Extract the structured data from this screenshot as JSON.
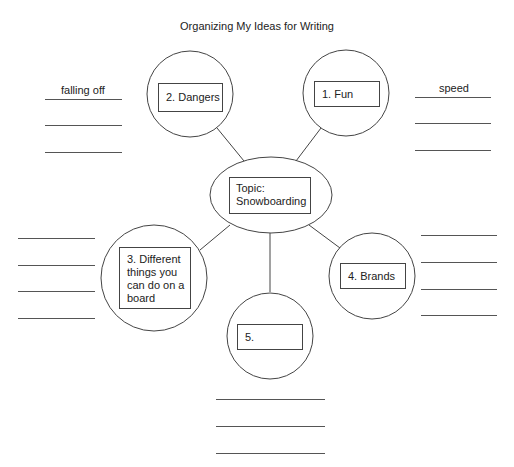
{
  "title": "Organizing My Ideas for Writing",
  "topic": {
    "label_line1": "Topic:",
    "label_line2": "Snowboarding"
  },
  "nodes": [
    {
      "id": 1,
      "label": "1. Fun"
    },
    {
      "id": 2,
      "label": "2. Dangers"
    },
    {
      "id": 3,
      "label_lines": [
        "3. Different",
        "things you",
        "can do on a",
        "board"
      ]
    },
    {
      "id": 4,
      "label": "4. Brands"
    },
    {
      "id": 5,
      "label": "5."
    }
  ],
  "detail_lists": {
    "fun": {
      "entries": [
        "speed",
        "",
        ""
      ]
    },
    "dangers": {
      "entries": [
        "falling off",
        "",
        ""
      ]
    },
    "different_things": {
      "entries": [
        "",
        "",
        "",
        ""
      ]
    },
    "brands": {
      "entries": [
        "",
        "",
        "",
        ""
      ]
    },
    "node5": {
      "entries": [
        "",
        "",
        ""
      ]
    }
  },
  "colors": {
    "stroke": "#444444",
    "background": "#ffffff",
    "text": "#222222"
  }
}
